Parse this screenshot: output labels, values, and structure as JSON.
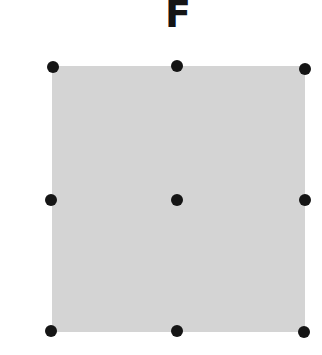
{
  "title": "F",
  "diagram": {
    "shape": "square",
    "fill_color": "#d4d4d4",
    "dot_color": "#151515",
    "dots": [
      {
        "id": "top-left",
        "x": 53,
        "y": 67
      },
      {
        "id": "top-center",
        "x": 177,
        "y": 66
      },
      {
        "id": "top-right",
        "x": 305,
        "y": 69
      },
      {
        "id": "middle-left",
        "x": 51,
        "y": 200
      },
      {
        "id": "center",
        "x": 177,
        "y": 200
      },
      {
        "id": "middle-right",
        "x": 305,
        "y": 200
      },
      {
        "id": "bottom-left",
        "x": 51,
        "y": 331
      },
      {
        "id": "bottom-center",
        "x": 177,
        "y": 331
      },
      {
        "id": "bottom-right",
        "x": 304,
        "y": 332
      }
    ]
  }
}
